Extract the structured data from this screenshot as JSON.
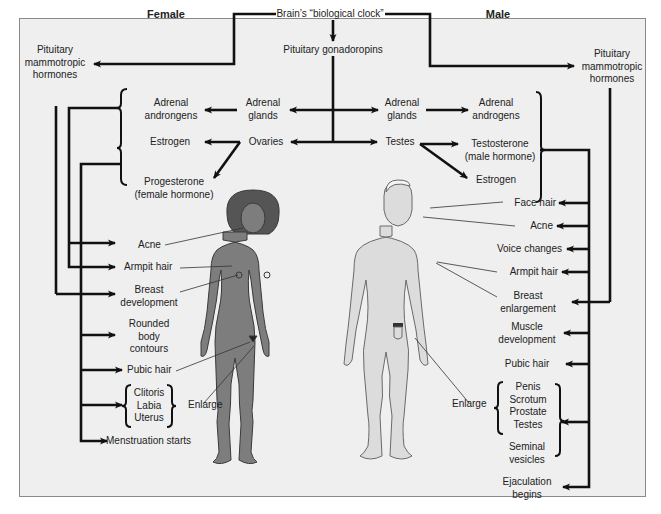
{
  "diagram": {
    "headers": {
      "female": "Female",
      "male": "Male"
    },
    "top": {
      "brain_clock": "Brain’s “biological clock”",
      "pituitary_gonadotropins": "Pituitary gonadoropins",
      "pituitary_mammotropic_left": "Pituitary\nmammotropic\nhormones",
      "pituitary_mammotropic_right": "Pituitary\nmammotropic\nhormones"
    },
    "female": {
      "adrenal_glands": "Adrenal\nglands",
      "adrenal_androgens": "Adrenal\nandrongens",
      "ovaries": "Ovaries",
      "estrogen": "Estrogen",
      "progesterone": "Progesterone\n(female hormone)",
      "effects": {
        "acne": "Acne",
        "armpit_hair": "Armpit hair",
        "breast_development": "Breast\ndevelopment",
        "rounded_body": "Rounded\nbody\ncontours",
        "pubic_hair": "Pubic hair",
        "organs": "Clitoris\nLabia\nUterus",
        "enlarge": "Enlarge",
        "menstruation": "Menstruation starts"
      }
    },
    "male": {
      "adrenal_glands": "Adrenal\nglands",
      "adrenal_androgens": "Adrenal\nandrogens",
      "testes": "Testes",
      "testosterone": "Testosterone\n(male hormone)",
      "estrogen": "Estrogen",
      "effects": {
        "face_hair": "Face hair",
        "acne": "Acne",
        "voice_changes": "Voice changes",
        "armpit_hair": "Armpit hair",
        "breast_enlargement": "Breast\nenlargement",
        "muscle_development": "Muscle\ndevelopment",
        "pubic_hair": "Pubic hair",
        "organs": "Penis\nScrotum\nProstate\nTestes",
        "seminal_vesicles": "Seminal\nvesicles",
        "enlarge": "Enlarge",
        "ejaculation": "Ejaculation\nbegins"
      }
    },
    "colors": {
      "background": "#efefef",
      "frame_border": "#8a8a8a",
      "line": "#111111",
      "female_skin": "#7d7d7d",
      "female_hair": "#555555",
      "male_skin": "#dcdcdc",
      "male_outline": "#6a6a6a"
    }
  }
}
